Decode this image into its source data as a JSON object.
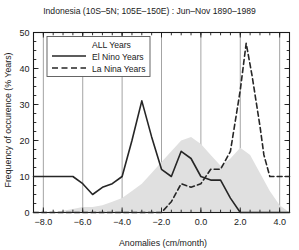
{
  "chart_data": {
    "type": "line",
    "title": "Indonesia (10S–5N; 105E–150E) : Jun–Nov 1890–1989",
    "xlabel": "Anomalies (cm/month)",
    "ylabel": "Frequency of occurence (% Years)",
    "xlim": [
      -8.5,
      4.5
    ],
    "ylim": [
      0,
      50
    ],
    "xticks": [
      -8.0,
      -6.0,
      -4.0,
      -2.0,
      0.0,
      2.0,
      4.0
    ],
    "xticklabels": [
      "−8.0",
      "−6.0",
      "−4.0",
      "−2.0",
      "0.0",
      "2.0",
      "4.0"
    ],
    "yticks": [
      0,
      10,
      20,
      30,
      40,
      50
    ],
    "yticklabels": [
      "0",
      "10",
      "20",
      "30",
      "40",
      "50"
    ],
    "xminorstep": 0.5,
    "yminorstep": 2.5,
    "grid": "vertical-major",
    "legend_position": "upper-left",
    "series": [
      {
        "name": "ALL Years",
        "style": "shaded-area",
        "color": "#e0e0e0",
        "x": [
          -8.5,
          -8.0,
          -7.5,
          -7.0,
          -6.5,
          -6.0,
          -5.5,
          -5.0,
          -4.5,
          -4.0,
          -3.5,
          -3.0,
          -2.5,
          -2.0,
          -1.5,
          -1.0,
          -0.5,
          0.0,
          0.5,
          1.0,
          1.5,
          2.0,
          2.5,
          3.0,
          3.5,
          4.0,
          4.5
        ],
        "values": [
          0,
          0,
          0,
          0.5,
          1,
          1.5,
          1.5,
          2,
          3,
          4,
          6,
          8,
          11,
          14,
          17,
          20,
          21,
          19,
          16,
          13,
          15,
          18,
          16,
          11,
          6,
          2,
          0
        ]
      },
      {
        "name": "El Nino Years",
        "style": "solid",
        "color": "#262626",
        "x": [
          -8.5,
          -8.0,
          -7.0,
          -6.5,
          -6.0,
          -5.5,
          -5.0,
          -4.5,
          -4.0,
          -3.5,
          -3.0,
          -2.5,
          -2.0,
          -1.5,
          -1.0,
          -0.5,
          0.0,
          0.5,
          1.0,
          1.5,
          2.0,
          3.0,
          4.0,
          4.5
        ],
        "values": [
          10,
          10,
          10,
          10,
          8,
          5,
          7,
          8,
          10,
          20,
          31,
          21,
          12,
          10,
          17,
          15,
          10,
          9,
          9,
          4,
          0,
          0,
          0,
          0
        ]
      },
      {
        "name": "La Nina Years",
        "style": "dashed",
        "color": "#262626",
        "x": [
          -8.5,
          -8.0,
          -6.0,
          -4.0,
          -2.0,
          -1.5,
          -1.0,
          -0.5,
          0.0,
          0.5,
          1.0,
          1.5,
          2.0,
          2.3,
          2.6,
          3.0,
          3.2,
          3.5,
          4.0,
          4.5
        ],
        "values": [
          0,
          0,
          0,
          0,
          0,
          3,
          8,
          7,
          8,
          12,
          12,
          17,
          34,
          47,
          38,
          24,
          16,
          10,
          10,
          10
        ]
      }
    ]
  },
  "legend": {
    "entries": [
      {
        "label": "ALL Years",
        "marker": "none"
      },
      {
        "label": "El Nino Years",
        "marker": "solid"
      },
      {
        "label": "La Nina Years",
        "marker": "dashed"
      }
    ]
  }
}
